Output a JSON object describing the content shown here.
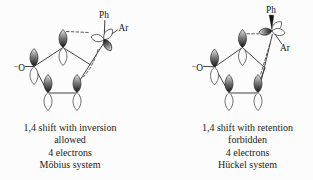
{
  "background": "#fcfcfc",
  "ink": "#222222",
  "left": {
    "oxide": "⁻O",
    "ph": "Ph",
    "ar": "Ar",
    "caption": [
      "1,4 shift with inversion",
      "allowed",
      "4 electrons",
      "Möbius system"
    ]
  },
  "right": {
    "oxide": "⁻O",
    "ph": "Ph",
    "ar": "Ar",
    "caption": [
      "1,4 shift with retention",
      "forbidden",
      "4 electrons",
      "Hückel system"
    ]
  }
}
